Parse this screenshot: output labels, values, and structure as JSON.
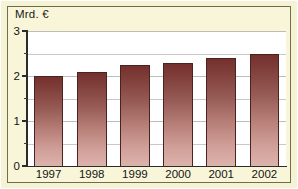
{
  "chart_data": {
    "type": "bar",
    "title": "",
    "subtitle": "",
    "xlabel": "",
    "ylabel": "Mrd. €",
    "categories": [
      "1997",
      "1998",
      "1999",
      "2000",
      "2001",
      "2002"
    ],
    "values": [
      2.0,
      2.1,
      2.25,
      2.3,
      2.4,
      2.5
    ],
    "series": [
      {
        "name": "",
        "values": [
          2.0,
          2.1,
          2.25,
          2.3,
          2.4,
          2.5
        ]
      }
    ],
    "ylim": [
      0,
      3
    ],
    "xlim_categories": 6,
    "y_ticks": [
      0,
      1,
      2,
      3
    ],
    "y_tick_labels": [
      "0",
      "1",
      "2",
      "3"
    ],
    "y_minor_ticks": [
      0.5,
      1.5,
      2.5
    ],
    "grid": true,
    "gridlines_at": [
      0.5,
      1.0,
      1.5,
      2.0,
      2.5,
      3.0
    ],
    "legend": false,
    "legend_position": "none",
    "annotations": [],
    "bar_color_top": "#74302d",
    "bar_color_bottom": "#dcb4ad",
    "bar_outline_color": "#4a2220",
    "plot_background": "#ffffff",
    "panel_background": "#f8f5d9",
    "frame_color": "#6e6e4a",
    "axis_color": "#2b2b2b",
    "gridline_color": "#c9c9c9",
    "text_color": "#141414"
  }
}
